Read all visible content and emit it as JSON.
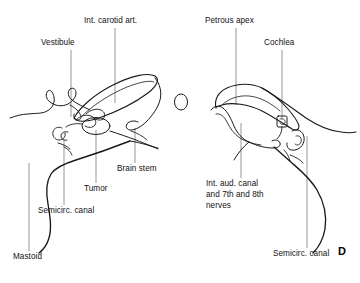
{
  "figure": {
    "panel_letter": "D",
    "ink_color": "#1a1a1a",
    "leader_color": "#5a5a5a",
    "background_color": "#ffffff"
  },
  "labels": {
    "vestibule": "Vestibule",
    "int_carotid_art": "Int. carotid art.",
    "petrous_apex": "Petrous apex",
    "cochlea": "Cochlea",
    "brain_stem": "Brain stem",
    "tumor": "Tumor",
    "semicirc_canal_left": "Semicirc. canal",
    "mastoid": "Mastoid",
    "int_aud_canal_line1": "Int. aud. canal",
    "int_aud_canal_line2": "and 7th and 8th",
    "int_aud_canal_line3": "nerves",
    "semicirc_canal_right": "Semicirc. canal"
  }
}
